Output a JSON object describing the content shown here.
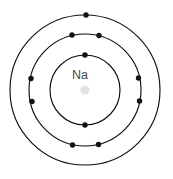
{
  "diagram": {
    "kind": "bohr-atom-model",
    "element_symbol": "Na",
    "canvas": {
      "width": 173,
      "height": 179
    },
    "center": {
      "x": 85,
      "y": 90
    },
    "colors": {
      "background": "#ffffff",
      "ring_stroke": "#0d0d0d",
      "electron_fill": "#121212",
      "nucleus_fill": "#e2e2e2",
      "symbol_text": "#4a4a4a"
    },
    "nucleus": {
      "label": "Na",
      "label_x": 80,
      "label_y": 76,
      "core_cx": 85,
      "core_cy": 90,
      "core_r": 4.6,
      "core_fill": "#e2e2e2"
    },
    "shells": [
      {
        "name": "K",
        "index": 1,
        "radius": 35,
        "electron_count": 2,
        "electrons": [
          {
            "x": 85.0,
            "y": 55.0
          },
          {
            "x": 85.0,
            "y": 125.0
          }
        ]
      },
      {
        "name": "L",
        "index": 2,
        "radius": 56,
        "electron_count": 8,
        "electrons": [
          {
            "x": 72.0,
            "y": 35.0
          },
          {
            "x": 99.0,
            "y": 35.5
          },
          {
            "x": 138.5,
            "y": 78.0
          },
          {
            "x": 139.5,
            "y": 101.0
          },
          {
            "x": 98.5,
            "y": 144.5
          },
          {
            "x": 72.5,
            "y": 145.0
          },
          {
            "x": 32.0,
            "y": 101.5
          },
          {
            "x": 31.0,
            "y": 78.5
          }
        ]
      },
      {
        "name": "M",
        "index": 3,
        "radius": 75,
        "electron_count": 1,
        "electrons": [
          {
            "x": 86.0,
            "y": 15.0
          }
        ]
      }
    ],
    "electron_radius": 2.7
  }
}
